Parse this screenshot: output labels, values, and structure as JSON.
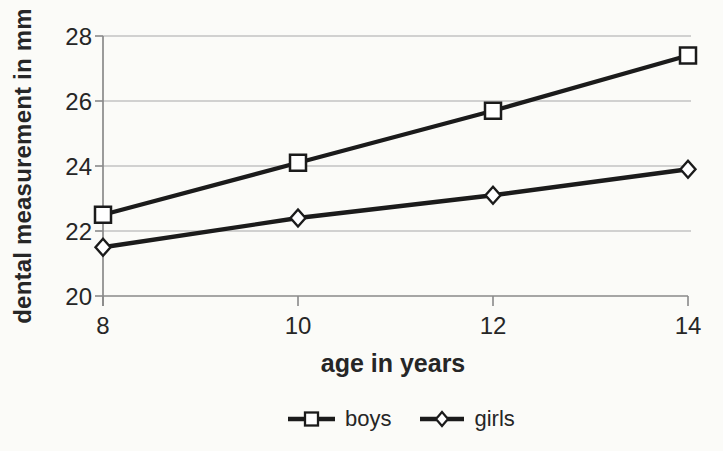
{
  "chart_data": {
    "type": "line",
    "title": "",
    "xlabel": "age in years",
    "ylabel": "dental measurement in mm",
    "x": [
      8,
      10,
      12,
      14
    ],
    "x_ticks": [
      "8",
      "10",
      "12",
      "14"
    ],
    "y_ticks": [
      "20",
      "22",
      "24",
      "26",
      "28"
    ],
    "xlim": [
      8,
      14
    ],
    "ylim": [
      20,
      28
    ],
    "grid": true,
    "legend_position": "bottom",
    "series": [
      {
        "name": "boys",
        "marker": "square",
        "values": [
          22.5,
          24.1,
          25.7,
          27.4
        ]
      },
      {
        "name": "girls",
        "marker": "diamond",
        "values": [
          21.5,
          22.4,
          23.1,
          23.9
        ]
      }
    ],
    "colors": {
      "line": "#1b1b1b",
      "grid": "#a8a8a8",
      "axis": "#8a8a8a",
      "text": "#262626",
      "marker_fill": "#ffffff",
      "background": "#fbfbf8"
    }
  },
  "legend": {
    "boys_label": "boys",
    "girls_label": "girls"
  }
}
